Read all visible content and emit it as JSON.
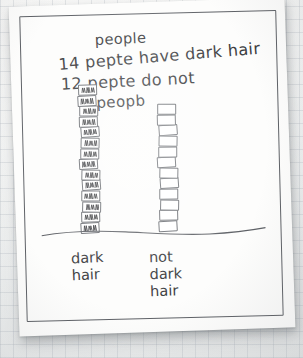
{
  "scene": {
    "description": "photograph of a child's hand-drawn bar chart on white paper",
    "surface_color": "#eef0f0",
    "paper_color": "#fdfdfc",
    "ink_color": "#3a3b3e"
  },
  "handwriting": {
    "title": "people",
    "statement_dark": "14 pepte have dark hair",
    "statement_not_dark": "12 pepte do not",
    "axis_caption": "peopb"
  },
  "chart_data": {
    "type": "bar",
    "title": "people",
    "xlabel": "",
    "ylabel": "peopb",
    "categories": [
      "dark hair",
      "not dark hair"
    ],
    "values": [
      14,
      12
    ],
    "ylim": [
      0,
      14
    ],
    "grid": false,
    "legend": null,
    "annotations": [
      "14 pepte have dark hair",
      "12 pepte do not"
    ],
    "series": [
      {
        "name": "people",
        "values": [
          14,
          12
        ]
      }
    ],
    "bar_style": [
      {
        "category": "dark hair",
        "unit_fill": "scribbled",
        "units": 14
      },
      {
        "category": "not dark hair",
        "unit_fill": "empty",
        "units": 12
      }
    ]
  },
  "axis": {
    "label_dark": "dark\nhair",
    "label_not_dark": "not\ndark\nhair"
  }
}
